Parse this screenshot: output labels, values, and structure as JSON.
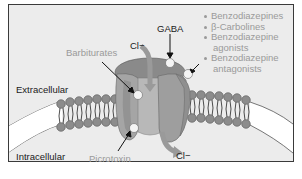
{
  "diagram": {
    "regions": {
      "extracellular": "Extracellular",
      "intracellular": "Intracellular"
    },
    "ions": {
      "cl_top": "Cl−",
      "cl_bottom": "Cl−"
    },
    "binding_sites": {
      "gaba": "GABA",
      "barbiturates": "Barbiturates",
      "picrotoxin": "Picrotoxin"
    },
    "legend": {
      "items": [
        {
          "label": "Benzodiazepines"
        },
        {
          "label": "β-Carbolines"
        },
        {
          "label": "Benzodiazepine"
        },
        {
          "label": "agonists"
        },
        {
          "label": "Benzodiazepine"
        },
        {
          "label": "antagonists"
        }
      ]
    },
    "colors": {
      "background": "#ececec",
      "membrane_head": "#8c8c8c",
      "channel": "#9a9a9a",
      "channel_light": "#b8b8b8",
      "site": "#f2f2f2",
      "label_dark": "#1a1a1a",
      "label_gray": "#9a9a9a"
    }
  }
}
